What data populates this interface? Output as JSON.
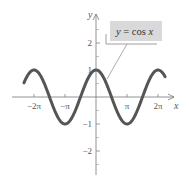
{
  "chart_data": {
    "type": "line",
    "title": "",
    "xlabel": "x",
    "ylabel": "y",
    "xlim": [
      -7.1,
      7.3
    ],
    "ylim": [
      -2.8,
      2.8
    ],
    "grid": false,
    "x_ticks": [
      {
        "value": -6.2832,
        "label": "−2π"
      },
      {
        "value": -3.1416,
        "label": "−π"
      },
      {
        "value": 3.1416,
        "label": "π"
      },
      {
        "value": 6.2832,
        "label": "2π"
      }
    ],
    "y_ticks": [
      {
        "value": 2,
        "label": "2"
      },
      {
        "value": 1,
        "label": "1"
      },
      {
        "value": -1,
        "label": "−1"
      },
      {
        "value": -2,
        "label": "−2"
      }
    ],
    "y_minor_ticks": [
      2.5,
      1.5,
      0.5,
      -0.5,
      -1.5,
      -2.5
    ],
    "series": [
      {
        "name": "y = cos x",
        "function": "cos",
        "x_range": [
          -7.3,
          7.0
        ],
        "color": "#555555"
      }
    ],
    "annotations": [
      {
        "text": "y = cos x",
        "box_color": "#d9d9d9",
        "points_to_x": 1.1
      }
    ]
  },
  "legend": {
    "label": "y = cos x"
  },
  "axes": {
    "x_label": "x",
    "y_label": "y"
  }
}
